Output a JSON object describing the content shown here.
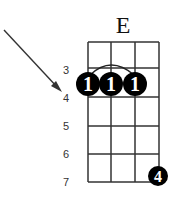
{
  "chord": {
    "name": "E",
    "strings": 4,
    "fret_labels": [
      "3",
      "4",
      "5",
      "6",
      "7"
    ],
    "barre": {
      "fret": "4",
      "from_string": 1,
      "to_string": 3,
      "finger": "1"
    },
    "fingers": [
      {
        "string": 1,
        "fret": "4",
        "finger": "1"
      },
      {
        "string": 2,
        "fret": "4",
        "finger": "1"
      },
      {
        "string": 3,
        "fret": "4",
        "finger": "1"
      },
      {
        "string": 4,
        "fret": "7",
        "finger": "4"
      }
    ],
    "arrow_points_to_fret": "4"
  },
  "colors": {
    "grid": "#333333",
    "dot": "#000000",
    "dot_text": "#ffffff",
    "arrow": "#333333"
  }
}
